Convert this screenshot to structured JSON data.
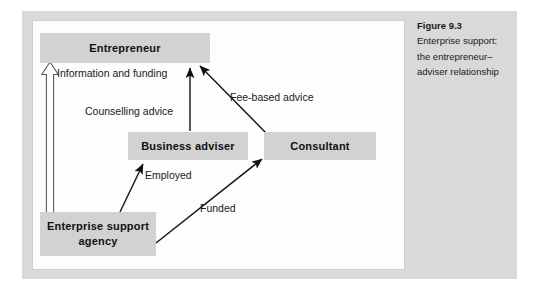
{
  "figure": {
    "caption_title": "Figure 9.3",
    "caption_lines": [
      "Enterprise support:",
      "the entrepreneur–",
      "adviser relationship"
    ]
  },
  "diagram": {
    "nodes": [
      {
        "id": "entrepreneur",
        "label": "Entrepreneur"
      },
      {
        "id": "business-adviser",
        "label": "Business adviser"
      },
      {
        "id": "consultant",
        "label": "Consultant"
      },
      {
        "id": "enterprise-support-agency",
        "label": "Enterprise support agency"
      }
    ],
    "edges": [
      {
        "id": "information-and-funding",
        "label": "Information and funding",
        "from": "enterprise-support-agency",
        "to": "entrepreneur",
        "style": "hollow-outline-arrow"
      },
      {
        "id": "counselling-advice",
        "label": "Counselling advice",
        "from": "business-adviser",
        "to": "entrepreneur",
        "style": "solid-arrow"
      },
      {
        "id": "fee-based-advice",
        "label": "Fee-based advice",
        "from": "consultant",
        "to": "entrepreneur",
        "style": "solid-arrow"
      },
      {
        "id": "employed",
        "label": "Employed",
        "from": "enterprise-support-agency",
        "to": "business-adviser",
        "style": "solid-arrow"
      },
      {
        "id": "funded",
        "label": "Funded",
        "from": "enterprise-support-agency",
        "to": "consultant",
        "style": "solid-arrow"
      }
    ]
  },
  "colors": {
    "outer_plate": "#d9d9d9",
    "canvas": "#fdfdfd",
    "node_fill": "#d2d2d2",
    "ink": "#101010"
  }
}
